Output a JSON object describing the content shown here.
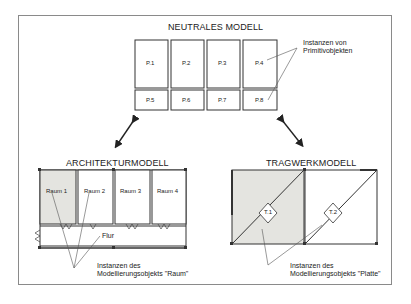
{
  "neutral_model": {
    "title": "NEUTRALES MODELL",
    "cells_top": [
      "P.1",
      "P.2",
      "P.3",
      "P.4"
    ],
    "cells_bottom": [
      "P.5",
      "P.6",
      "P.7",
      "P.8"
    ],
    "annotation_line1": "Instanzen von",
    "annotation_line2": "Primitivobjekten"
  },
  "architecture_model": {
    "title": "ARCHITEKTURMODELL",
    "rooms": [
      "Raum 1",
      "Raum 2",
      "Raum 3",
      "Raum 4"
    ],
    "corridor": "Flur",
    "annotation_line1": "Instanzen des",
    "annotation_line2": "Modellierungsobjekts \"Raum\""
  },
  "structural_model": {
    "title": "TRAGWERKMODELL",
    "plates": [
      "T.1",
      "T.2"
    ],
    "annotation_line1": "Instanzen des",
    "annotation_line2": "Modellierungsobjekts \"Platte\""
  },
  "colors": {
    "line": "#333333",
    "frame": "#8a8a8a",
    "shaded": "#e4e4e0"
  }
}
